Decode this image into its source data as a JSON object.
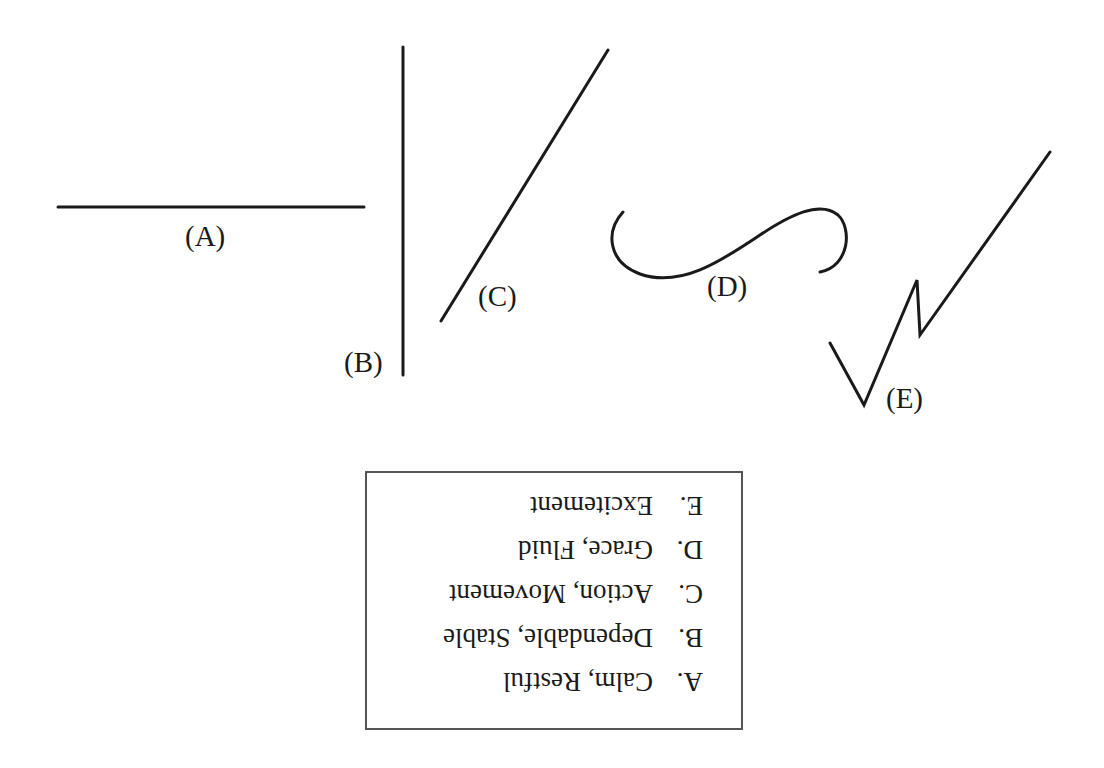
{
  "figure": {
    "lines": [
      {
        "id": "A",
        "label": "(A)",
        "shape": "horizontal line"
      },
      {
        "id": "B",
        "label": "(B)",
        "shape": "vertical line"
      },
      {
        "id": "C",
        "label": "(C)",
        "shape": "diagonal line"
      },
      {
        "id": "D",
        "label": "(D)",
        "shape": "S curve"
      },
      {
        "id": "E",
        "label": "(E)",
        "shape": "zigzag line"
      }
    ]
  },
  "legend": {
    "orientation": "rotated 180 degrees",
    "items": [
      {
        "key": "A.",
        "meaning": "Calm, Restful"
      },
      {
        "key": "B.",
        "meaning": "Dependable, Stable"
      },
      {
        "key": "C.",
        "meaning": "Action, Movement"
      },
      {
        "key": "D.",
        "meaning": "Grace, Fluid"
      },
      {
        "key": "E.",
        "meaning": "Excitement"
      }
    ]
  },
  "colors": {
    "stroke": "#1a1a1a",
    "border": "#555555",
    "background": "#ffffff"
  }
}
